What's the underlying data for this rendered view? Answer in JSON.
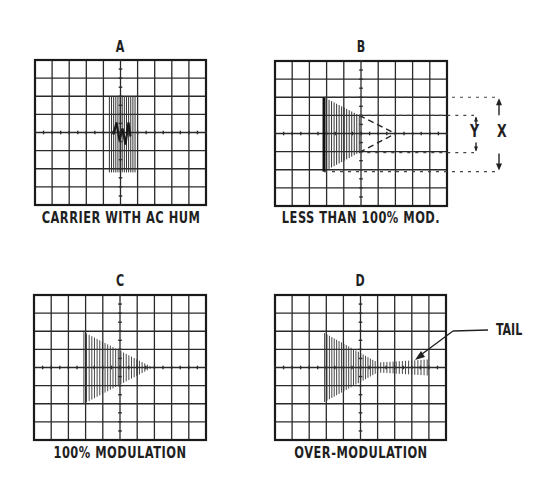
{
  "figure": {
    "grid": {
      "cols": 10,
      "rows": 8,
      "line_color": "#2a2a2a",
      "frame_color": "#1a1a1a"
    },
    "panels": [
      {
        "id": "A",
        "letter": "A",
        "caption": "CARRIER WITH AC HUM",
        "box": {
          "x": 35,
          "y": 60,
          "w": 171,
          "h": 145
        },
        "letter_pos": {
          "x": 100,
          "y": 38
        },
        "caption_pos": {
          "x": 1,
          "y": 210
        },
        "waveform": "hum"
      },
      {
        "id": "B",
        "letter": "B",
        "caption": "LESS THAN 100% MOD.",
        "box": {
          "x": 275,
          "y": 61,
          "w": 172,
          "h": 145
        },
        "letter_pos": {
          "x": 342,
          "y": 38
        },
        "caption_pos": {
          "x": 240,
          "y": 210
        },
        "waveform": "partial"
      },
      {
        "id": "C",
        "letter": "C",
        "caption": "100% MODULATION",
        "box": {
          "x": 34,
          "y": 295,
          "w": 172,
          "h": 145
        },
        "letter_pos": {
          "x": 100,
          "y": 273
        },
        "caption_pos": {
          "x": 0,
          "y": 444
        },
        "waveform": "full"
      },
      {
        "id": "D",
        "letter": "D",
        "caption": "OVER-MODULATION",
        "box": {
          "x": 275,
          "y": 295,
          "w": 171,
          "h": 145
        },
        "letter_pos": {
          "x": 341,
          "y": 273
        },
        "caption_pos": {
          "x": 240,
          "y": 444
        },
        "waveform": "over"
      }
    ],
    "annotations": {
      "x_label": "X",
      "y_label": "Y",
      "tail_label": "TAIL"
    }
  }
}
